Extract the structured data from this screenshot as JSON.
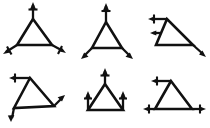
{
  "image": {
    "title": "Triangle force-vector diagram sheet",
    "background_color": "#ffffff",
    "ink_color": "#111111",
    "width": 210,
    "height": 128,
    "layout": "2 rows x 3 columns of hand-drawn triangle sketches"
  },
  "figures": [
    {
      "id": "figure-1",
      "name": "triangle-arrows-outward",
      "row": 1,
      "column": 1,
      "shape": "equilateral-triangle",
      "orientation": "apex-up",
      "arrow_count": 3,
      "arrows": [
        {
          "at": "apex",
          "direction": "up",
          "has_cross_tick": true
        },
        {
          "at": "bottom-left-vertex",
          "direction": "down-left",
          "has_cross_tick": true
        },
        {
          "at": "bottom-right-vertex",
          "direction": "down-right",
          "has_cross_tick": true
        }
      ]
    },
    {
      "id": "figure-2",
      "name": "narrow-triangle-apex-up-base-arrows-down",
      "row": 1,
      "column": 2,
      "shape": "narrow-triangle",
      "orientation": "apex-up",
      "arrow_count": 3,
      "arrows": [
        {
          "at": "apex",
          "direction": "up",
          "has_cross_tick": true
        },
        {
          "at": "bottom-left-vertex",
          "direction": "down-left",
          "has_cross_tick": false
        },
        {
          "at": "bottom-right-vertex",
          "direction": "down-right",
          "has_cross_tick": false
        }
      ]
    },
    {
      "id": "figure-3",
      "name": "triangle-left-arrow-right-diagonal-arrow",
      "row": 1,
      "column": 3,
      "shape": "right-leaning-triangle",
      "orientation": "apex-up",
      "arrow_count": 3,
      "arrows": [
        {
          "at": "apex",
          "direction": "left",
          "has_cross_tick": true
        },
        {
          "at": "left-edge-mid",
          "direction": "left",
          "has_cross_tick": false
        },
        {
          "at": "bottom-right-vertex",
          "direction": "down-right",
          "has_cross_tick": false
        }
      ]
    },
    {
      "id": "figure-4",
      "name": "skewed-triangle-left-and-diagonal-arrows",
      "row": 2,
      "column": 1,
      "shape": "skewed-triangle",
      "orientation": "apex-up",
      "arrow_count": 3,
      "arrows": [
        {
          "at": "apex",
          "direction": "left",
          "has_cross_tick": true
        },
        {
          "at": "bottom-left-vertex",
          "direction": "down-left",
          "has_cross_tick": false
        },
        {
          "at": "right-vertex",
          "direction": "up-right",
          "has_cross_tick": false
        }
      ]
    },
    {
      "id": "figure-5",
      "name": "triangle-three-arrows-up",
      "row": 2,
      "column": 2,
      "shape": "equilateral-triangle",
      "orientation": "apex-up",
      "arrow_count": 3,
      "arrows": [
        {
          "at": "apex",
          "direction": "up",
          "has_cross_tick": true
        },
        {
          "at": "bottom-left-vertex",
          "direction": "up",
          "has_cross_tick": true
        },
        {
          "at": "bottom-right-vertex",
          "direction": "up",
          "has_cross_tick": true
        }
      ]
    },
    {
      "id": "figure-6",
      "name": "triangle-horizontal-arrows",
      "row": 2,
      "column": 3,
      "shape": "equilateral-triangle",
      "orientation": "apex-up",
      "arrow_count": 3,
      "arrows": [
        {
          "at": "apex",
          "direction": "left",
          "has_cross_tick": true
        },
        {
          "at": "bottom-left-vertex",
          "direction": "left",
          "has_cross_tick": true
        },
        {
          "at": "bottom-right-vertex",
          "direction": "right",
          "has_cross_tick": true
        }
      ]
    }
  ]
}
